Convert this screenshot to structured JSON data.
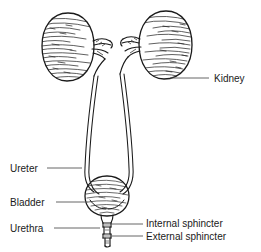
{
  "figure": {
    "style": "line drawing with hatching",
    "background_color": "#ffffff",
    "ink_color": "#1a1a1a",
    "leader_line_color": "#555555"
  },
  "labels": [
    {
      "id": "kidney",
      "text": "Kidney",
      "text_x": 214,
      "text_y": 82,
      "anchor": "start",
      "leader": {
        "x1": 170,
        "y1": 78,
        "x2": 209,
        "y2": 78
      }
    },
    {
      "id": "ureter",
      "text": "Ureter",
      "text_x": 10,
      "text_y": 172,
      "anchor": "start",
      "leader": {
        "x1": 47,
        "y1": 168,
        "x2": 82,
        "y2": 168
      }
    },
    {
      "id": "bladder",
      "text": "Bladder",
      "text_x": 10,
      "text_y": 206,
      "anchor": "start",
      "leader": {
        "x1": 56,
        "y1": 202,
        "x2": 88,
        "y2": 202
      }
    },
    {
      "id": "urethra",
      "text": "Urethra",
      "text_x": 10,
      "text_y": 232,
      "anchor": "start",
      "leader": {
        "x1": 54,
        "y1": 228,
        "x2": 100,
        "y2": 228
      }
    },
    {
      "id": "internal-sphincter",
      "text": "Internal sphincter",
      "text_x": 146,
      "text_y": 227,
      "anchor": "start",
      "leader": {
        "x1": 110,
        "y1": 224,
        "x2": 143,
        "y2": 224
      }
    },
    {
      "id": "external-sphincter",
      "text": "External sphincter",
      "text_x": 146,
      "text_y": 240,
      "anchor": "start",
      "leader": {
        "x1": 110,
        "y1": 236,
        "x2": 143,
        "y2": 236
      }
    }
  ],
  "anatomy": {
    "left_kidney": {
      "name": "left-kidney",
      "center_x": 68,
      "center_y": 47,
      "width": 52,
      "height": 68
    },
    "right_kidney": {
      "name": "right-kidney",
      "center_x": 165,
      "center_y": 45,
      "width": 54,
      "height": 68
    },
    "bladder": {
      "name": "bladder",
      "center_x": 107,
      "center_y": 196,
      "width": 42,
      "height": 40
    },
    "urethra": {
      "name": "urethra",
      "top_y": 216,
      "bottom_y": 248,
      "center_x": 107
    },
    "left_ureter": {
      "name": "left-ureter",
      "from": "left-kidney-hilum",
      "to": "bladder"
    },
    "right_ureter": {
      "name": "right-ureter",
      "from": "right-kidney-hilum",
      "to": "bladder"
    }
  }
}
